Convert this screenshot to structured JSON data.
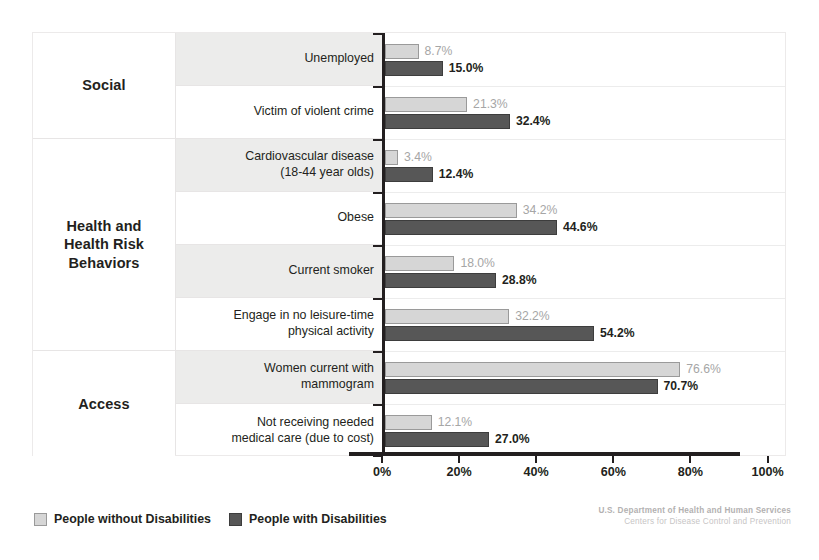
{
  "chart_data": {
    "type": "bar",
    "orientation": "horizontal",
    "title": "",
    "xlabel": "",
    "ylabel": "",
    "xlim": [
      0,
      100
    ],
    "xticks": [
      "0%",
      "20%",
      "40%",
      "60%",
      "80%",
      "100%"
    ],
    "xtick_values": [
      0,
      20,
      40,
      60,
      80,
      100
    ],
    "grid": false,
    "legend_position": "bottom-left",
    "categories": [
      "Unemployed",
      "Victim of violent crime",
      "Cardiovascular disease (18-44 year olds)",
      "Obese",
      "Current smoker",
      "Engage in no leisure-time physical activity",
      "Women current with mammogram",
      "Not receiving needed medical care (due to cost)"
    ],
    "series": [
      {
        "name": "People without Disabilities",
        "color": "#d6d6d6",
        "values": [
          8.7,
          21.3,
          3.4,
          34.2,
          18.0,
          32.2,
          76.6,
          12.1
        ],
        "labels": [
          "8.7%",
          "21.3%",
          "3.4%",
          "34.2%",
          "18.0%",
          "32.2%",
          "76.6%",
          "12.1%"
        ]
      },
      {
        "name": "People with Disabilities",
        "color": "#575757",
        "values": [
          15.0,
          32.4,
          12.4,
          44.6,
          28.8,
          54.2,
          70.7,
          27.0
        ],
        "labels": [
          "15.0%",
          "32.4%",
          "12.4%",
          "44.6%",
          "28.8%",
          "54.2%",
          "70.7%",
          "27.0%"
        ]
      }
    ]
  },
  "groups": [
    {
      "label": "Social",
      "rows": 2
    },
    {
      "label": "Health and\nHealth Risk\nBehaviors",
      "rows": 4
    },
    {
      "label": "Access",
      "rows": 2
    }
  ],
  "rows": [
    {
      "label_lines": [
        "Unemployed"
      ],
      "shaded": true
    },
    {
      "label_lines": [
        "Victim of violent crime"
      ],
      "shaded": false
    },
    {
      "label_lines": [
        "Cardiovascular disease",
        "(18-44 year olds)"
      ],
      "shaded": true
    },
    {
      "label_lines": [
        "Obese"
      ],
      "shaded": false
    },
    {
      "label_lines": [
        "Current smoker"
      ],
      "shaded": true
    },
    {
      "label_lines": [
        "Engage in no leisure-time",
        "physical activity"
      ],
      "shaded": false
    },
    {
      "label_lines": [
        "Women current with",
        "mammogram"
      ],
      "shaded": true
    },
    {
      "label_lines": [
        "Not receiving needed",
        "medical care (due to cost)"
      ],
      "shaded": false
    }
  ],
  "legend": [
    {
      "label": "People without Disabilities",
      "swatch": "light"
    },
    {
      "label": "People with Disabilities",
      "swatch": "dark"
    }
  ],
  "footer": {
    "line1": "U.S. Department of Health and Human Services",
    "line2": "Centers for Disease Control and Prevention"
  }
}
